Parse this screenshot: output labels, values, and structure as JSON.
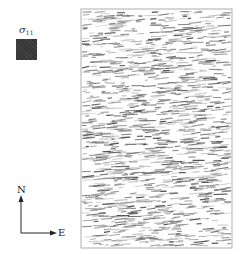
{
  "legend": {
    "symbol": "σ",
    "subscript": "11",
    "swatch_color": "#3b3b3b"
  },
  "compass": {
    "north_label": "N",
    "east_label": "E",
    "color": "#222222"
  },
  "field": {
    "frame": {
      "x": 81,
      "y": 9,
      "width": 151,
      "height": 239,
      "stroke": "#9a9a9a"
    },
    "dash_orientation_deg": -4,
    "dash_count": 1400,
    "dash_length_range": [
      3,
      14
    ],
    "dash_gray_range": [
      70,
      215
    ],
    "seed": 11
  }
}
